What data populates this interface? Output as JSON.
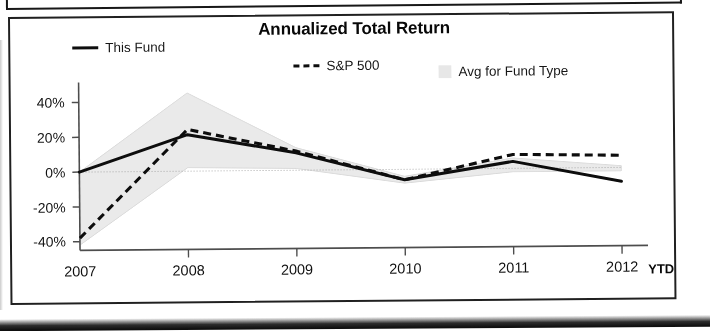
{
  "panel": {
    "title": "Annualized Total Return"
  },
  "legend": [
    {
      "label": "This Fund",
      "marker": "solid-line-swatch"
    },
    {
      "label": "S&P 500",
      "marker": "dashed-line-swatch"
    },
    {
      "label": "Avg for Fund Type",
      "marker": "shaded-band-swatch"
    }
  ],
  "axis": {
    "ytd_note": "YTD",
    "ylabels": [
      "40%",
      "20%",
      "0%",
      "-20%",
      "-40%"
    ],
    "xlabels": [
      "2007",
      "2008",
      "2009",
      "2010",
      "2011",
      "2012"
    ]
  },
  "colors": {
    "this_fund_line": "#111111",
    "sp500_line": "#111111",
    "band_fill": "#e6e6e6",
    "axis": "#4a4a4a",
    "text": "#151515",
    "border": "#242424"
  },
  "chart_data": {
    "type": "line",
    "title": "Annualized Total Return",
    "xlabel": "",
    "ylabel": "",
    "x": [
      "2007",
      "2008",
      "2009",
      "2010",
      "2011",
      "2012"
    ],
    "ylim": [
      -45,
      47
    ],
    "yticks": [
      40,
      20,
      0,
      -20,
      -40
    ],
    "ytick_labels": [
      "40%",
      "20%",
      "0%",
      "-20%",
      "-40%"
    ],
    "grid": false,
    "legend_position": "top",
    "series": [
      {
        "name": "This Fund",
        "style": "solid",
        "values": [
          0,
          21,
          10,
          -6,
          4,
          -8
        ]
      },
      {
        "name": "S&P 500",
        "style": "dashed",
        "values": [
          -38,
          24,
          11,
          -6,
          8,
          7
        ]
      }
    ],
    "band": {
      "name": "Avg for Fund Type",
      "style": "shaded-area",
      "upper": [
        0,
        45,
        13,
        -4,
        6,
        1
      ],
      "lower": [
        -42,
        2,
        1,
        -8,
        -2,
        -2
      ]
    },
    "annotations": [
      {
        "text": "YTD",
        "near": "2012",
        "position": "x-axis-right"
      }
    ]
  }
}
